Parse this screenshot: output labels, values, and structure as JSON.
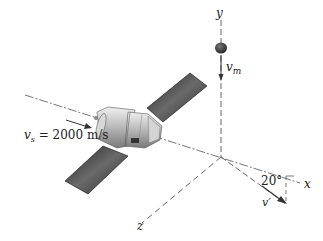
{
  "diagram": {
    "axes": {
      "x": "x",
      "y": "y",
      "z": "z"
    },
    "labels": {
      "satellite_velocity": "v",
      "satellite_velocity_sub": "s",
      "satellite_velocity_value": " = 2000 m/s",
      "meteor_velocity": "v",
      "meteor_velocity_sub": "m",
      "final_velocity": "v′",
      "angle": "20°"
    },
    "objects": [
      "satellite",
      "solar-panel-upper",
      "solar-panel-lower",
      "meteoroid"
    ],
    "colors": {
      "axis": "#777777",
      "panel": "#3a3a3a",
      "body": "#c8c8c8",
      "text": "#222222"
    }
  }
}
